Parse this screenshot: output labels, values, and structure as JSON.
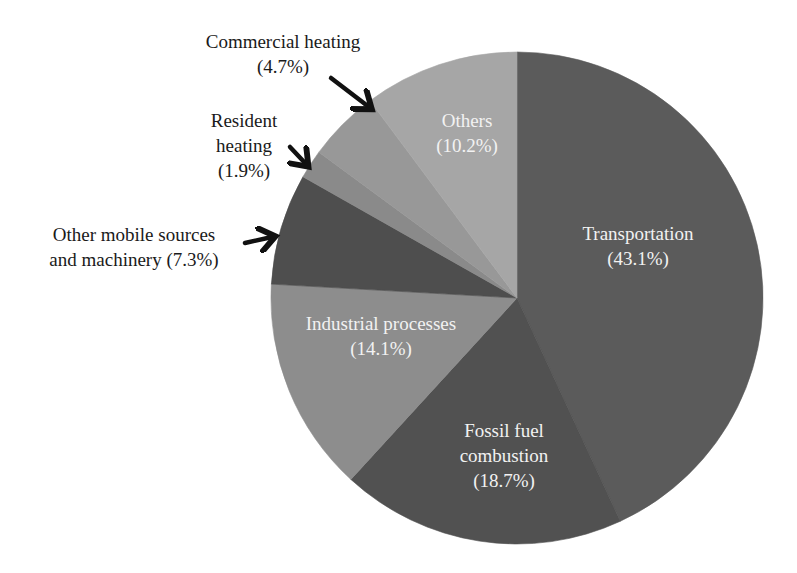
{
  "chart_data": {
    "type": "pie",
    "title": "",
    "start_angle_deg": 0,
    "direction": "clockwise",
    "slices": [
      {
        "label": "Transportation",
        "value": 43.1,
        "value_label": "(43.1%)",
        "color": "#5b5b5b"
      },
      {
        "label": "Fossil fuel combustion",
        "value": 18.7,
        "value_label": "(18.7%)",
        "color": "#515151"
      },
      {
        "label": "Industrial processes",
        "value": 14.1,
        "value_label": "(14.1%)",
        "color": "#8d8d8d"
      },
      {
        "label": "Other mobile sources and machinery",
        "value": 7.3,
        "value_label": "(7.3%)",
        "color": "#4e4e4e"
      },
      {
        "label": "Resident heating",
        "value": 1.9,
        "value_label": "(1.9%)",
        "color": "#8a8a8a"
      },
      {
        "label": "Commercial heating",
        "value": 4.7,
        "value_label": "(4.7%)",
        "color": "#989898"
      },
      {
        "label": "Others",
        "value": 10.2,
        "value_label": "(10.2%)",
        "color": "#a6a6a6"
      }
    ],
    "legend": "none (labels placed on/near slices)",
    "unit": "%"
  },
  "labels": {
    "transportation": {
      "line1": "Transportation",
      "line2": "(43.1%)"
    },
    "fossil": {
      "line1": "Fossil fuel",
      "line2": "combustion",
      "line3": "(18.7%)"
    },
    "industrial": {
      "line1": "Industrial processes",
      "line2": "(14.1%)"
    },
    "other_mobile": {
      "line1": "Other mobile sources",
      "line2": "and machinery (7.3%)"
    },
    "resident": {
      "line1": "Resident",
      "line2": "heating",
      "line3": "(1.9%)"
    },
    "commercial": {
      "line1": "Commercial heating",
      "line2": "(4.7%)"
    },
    "others": {
      "line1": "Others",
      "line2": "(10.2%)"
    }
  }
}
